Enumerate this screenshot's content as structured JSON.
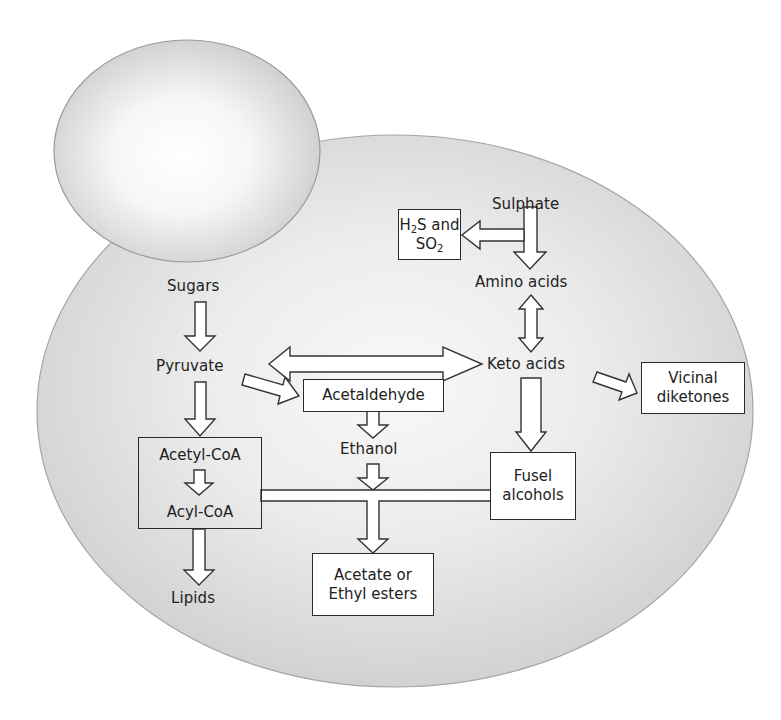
{
  "diagram": {
    "colors": {
      "background": "#ffffff",
      "cell_fill_center": "#f7f7f7",
      "cell_fill_edge": "#cfcfcf",
      "cell_outline": "#9a9a9a",
      "bud_fill_center": "#ffffff",
      "bud_fill_edge": "#c8c8c8",
      "box_border": "#2a2a2a",
      "box_fill": "#ffffff",
      "arrow_fill": "#ffffff",
      "arrow_stroke": "#333333",
      "text": "#222222"
    },
    "nodes": {
      "sulphate": "Sulphate",
      "h2s_so2": {
        "line1_a": "H",
        "line1_sub": "2",
        "line1_b": "S and",
        "line2_a": "SO",
        "line2_sub": "2"
      },
      "amino_acids": "Amino acids",
      "sugars": "Sugars",
      "pyruvate": "Pyruvate",
      "keto_acids": "Keto acids",
      "acetaldehyde": "Acetaldehyde",
      "vicinal_diketones": {
        "line1": "Vicinal",
        "line2": "diketones"
      },
      "ethanol": "Ethanol",
      "acetyl_coa": "Acetyl-CoA",
      "acyl_coa": "Acyl-CoA",
      "fusel_alcohols": {
        "line1": "Fusel",
        "line2": "alcohols"
      },
      "lipids": "Lipids",
      "acetate_esters": {
        "line1": "Acetate or",
        "line2": "Ethyl esters"
      }
    },
    "edges": [
      {
        "from": "Sulphate",
        "to": "Amino acids",
        "type": "single"
      },
      {
        "from": "Sulphate",
        "to": "H2S and SO2",
        "type": "single"
      },
      {
        "from": "Amino acids",
        "to": "Keto acids",
        "type": "bidirectional"
      },
      {
        "from": "Sugars",
        "to": "Pyruvate",
        "type": "single"
      },
      {
        "from": "Pyruvate",
        "to": "Keto acids",
        "type": "bidirectional"
      },
      {
        "from": "Pyruvate",
        "to": "Acetaldehyde",
        "type": "single"
      },
      {
        "from": "Pyruvate",
        "to": "Acetyl-CoA",
        "type": "single"
      },
      {
        "from": "Keto acids",
        "to": "Vicinal diketones",
        "type": "single"
      },
      {
        "from": "Keto acids",
        "to": "Fusel alcohols",
        "type": "single"
      },
      {
        "from": "Acetaldehyde",
        "to": "Ethanol",
        "type": "single"
      },
      {
        "from": "Acetyl-CoA",
        "to": "Acyl-CoA",
        "type": "single"
      },
      {
        "from": "Acyl-CoA",
        "to": "Lipids",
        "type": "single"
      },
      {
        "from": "Ethanol",
        "to": "Acetate or Ethyl esters",
        "type": "single"
      },
      {
        "from": "Acyl-CoA + Fusel alcohols",
        "to": "Acetate or Ethyl esters",
        "type": "merge"
      }
    ]
  }
}
